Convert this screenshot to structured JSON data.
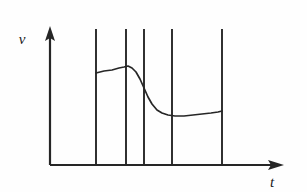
{
  "figure": {
    "title": "",
    "background_color": "#fefefe",
    "ink_color": "#262626",
    "axis_label_y": "v",
    "axis_label_x": "t"
  },
  "chart_data": {
    "type": "line",
    "title": "",
    "xlabel": "t",
    "ylabel": "v",
    "grid": false,
    "legend": null,
    "axes": {
      "x_axis": {
        "label": "t",
        "arrow": true,
        "origin_px": [
          50,
          165
        ],
        "end_px": [
          283,
          165
        ],
        "ticks": [],
        "tick_labels": []
      },
      "y_axis": {
        "label": "v",
        "arrow": true,
        "origin_px": [
          50,
          165
        ],
        "end_px": [
          50,
          28
        ],
        "ticks": [],
        "tick_labels": []
      }
    },
    "vertical_markers": {
      "description": "Five vertical boundary lines spanning from the baseline up to the top of the plot area",
      "count": 5,
      "x_px": [
        96,
        126,
        144,
        172,
        222
      ],
      "y_top_px": 29,
      "y_bottom_px": 165
    },
    "series": [
      {
        "name": "v(t)",
        "style": "solid",
        "color": "#262626",
        "description": "Velocity profile: starts at a moderate plateau, rises slightly to a local peak, drops steeply to a lower plateau, then rises gently at the end",
        "points_px": [
          [
            96,
            73
          ],
          [
            104,
            71
          ],
          [
            112,
            70
          ],
          [
            119,
            68
          ],
          [
            124,
            67
          ],
          [
            128,
            66
          ],
          [
            132,
            68
          ],
          [
            136,
            72
          ],
          [
            140,
            79
          ],
          [
            144,
            88
          ],
          [
            148,
            97
          ],
          [
            152,
            104
          ],
          [
            157,
            110
          ],
          [
            162,
            113
          ],
          [
            168,
            115
          ],
          [
            175,
            116
          ],
          [
            184,
            116
          ],
          [
            193,
            115
          ],
          [
            202,
            114
          ],
          [
            211,
            113
          ],
          [
            218,
            112
          ],
          [
            222,
            111
          ]
        ]
      }
    ]
  }
}
